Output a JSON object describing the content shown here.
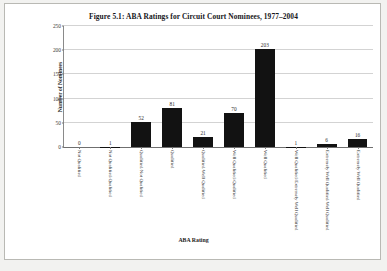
{
  "figure": {
    "title": "Figure 5.1: ABA Ratings for Circuit Court Nominees, 1977–2004"
  },
  "chart_data": {
    "type": "bar",
    "title": "Figure 5.1: ABA Ratings for Circuit Court Nominees, 1977–2004",
    "xlabel": "ABA Rating",
    "ylabel": "Number of Nominees",
    "ylim": [
      0,
      250
    ],
    "yticks": [
      0,
      50,
      100,
      150,
      200,
      250
    ],
    "grid": true,
    "legend": "none",
    "bar_color": "#121212",
    "categories": [
      "Not Qualified",
      "Not Qualified/Qualified",
      "Qualified/Not Qualified",
      "Qualified",
      "Qualified/Well Qualified",
      "Well Qualified/Qualified",
      "Well Qualified",
      "Well Qualified/Extremely Well Qualified",
      "Extremely Well Qualified/Well Qualified",
      "Extremely Well Qualified"
    ],
    "values": [
      0,
      1,
      52,
      81,
      21,
      70,
      203,
      1,
      6,
      16
    ],
    "data_labels": [
      "0",
      "1",
      "52",
      "81",
      "21",
      "70",
      "203",
      "1",
      "6",
      "16"
    ]
  }
}
